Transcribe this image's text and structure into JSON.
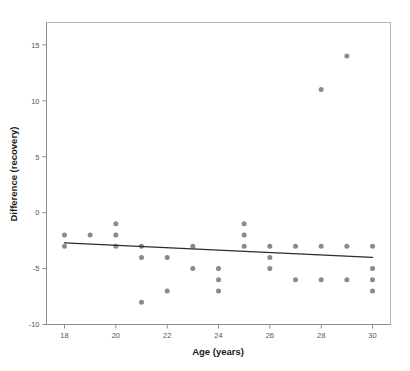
{
  "chart_data": {
    "type": "scatter",
    "title": "",
    "xlabel": "Age (years)",
    "ylabel": "Difference (recovery)",
    "xlim": [
      17.3,
      30.7
    ],
    "ylim": [
      -10,
      17
    ],
    "xticks": [
      18,
      20,
      22,
      24,
      26,
      28,
      30
    ],
    "xtick_labels": [
      "18",
      "20",
      "22",
      "24",
      "26",
      "28",
      "30"
    ],
    "yticks": [
      15,
      10,
      5,
      0,
      -5,
      -10
    ],
    "ytick_labels": [
      "15",
      "10",
      "5",
      "0",
      "-5",
      "-10"
    ],
    "grid": false,
    "legend": null,
    "marker_color": "#8a8a8a",
    "marker_size": 5,
    "frame_color": "#b8b8b8",
    "axis_color": "#8e8e8e",
    "points": [
      {
        "x": 18,
        "y": -2
      },
      {
        "x": 18,
        "y": -3
      },
      {
        "x": 19,
        "y": -2
      },
      {
        "x": 20,
        "y": -1
      },
      {
        "x": 20,
        "y": -2
      },
      {
        "x": 20,
        "y": -3
      },
      {
        "x": 21,
        "y": -3
      },
      {
        "x": 21,
        "y": -4
      },
      {
        "x": 21,
        "y": -8
      },
      {
        "x": 22,
        "y": -4
      },
      {
        "x": 22,
        "y": -7
      },
      {
        "x": 23,
        "y": -3
      },
      {
        "x": 23,
        "y": -5
      },
      {
        "x": 24,
        "y": -5
      },
      {
        "x": 24,
        "y": -6
      },
      {
        "x": 24,
        "y": -7
      },
      {
        "x": 25,
        "y": -1
      },
      {
        "x": 25,
        "y": -2
      },
      {
        "x": 25,
        "y": -3
      },
      {
        "x": 26,
        "y": -3
      },
      {
        "x": 26,
        "y": -4
      },
      {
        "x": 26,
        "y": -5
      },
      {
        "x": 27,
        "y": -3
      },
      {
        "x": 27,
        "y": -6
      },
      {
        "x": 28,
        "y": -3
      },
      {
        "x": 28,
        "y": -6
      },
      {
        "x": 28,
        "y": 11
      },
      {
        "x": 29,
        "y": -3
      },
      {
        "x": 29,
        "y": -6
      },
      {
        "x": 29,
        "y": 14
      },
      {
        "x": 30,
        "y": -3
      },
      {
        "x": 30,
        "y": -5
      },
      {
        "x": 30,
        "y": -6
      },
      {
        "x": 30,
        "y": -7
      }
    ],
    "fit_line": {
      "type": "linear",
      "x_start": 18,
      "y_start": -2.7,
      "x_end": 30,
      "y_end": -4.0,
      "color": "#2b2b2b"
    }
  }
}
